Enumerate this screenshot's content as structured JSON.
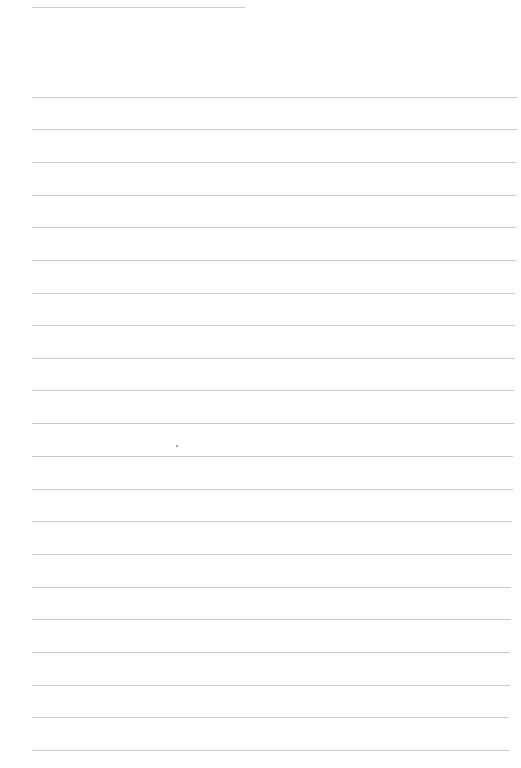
{
  "page": {
    "type": "lined-paper",
    "background": "#ffffff",
    "rule_color": "#c9c9c9",
    "header_rule": {
      "x": 32,
      "y": 7,
      "width": 213
    },
    "rules": [
      {
        "y": 97,
        "x": 32,
        "width": 485
      },
      {
        "y": 129,
        "x": 32,
        "width": 485
      },
      {
        "y": 162,
        "x": 32,
        "width": 484
      },
      {
        "y": 195,
        "x": 32,
        "width": 484
      },
      {
        "y": 227,
        "x": 32,
        "width": 484
      },
      {
        "y": 260,
        "x": 32,
        "width": 484
      },
      {
        "y": 293,
        "x": 32,
        "width": 483
      },
      {
        "y": 325,
        "x": 32,
        "width": 483
      },
      {
        "y": 358,
        "x": 32,
        "width": 483
      },
      {
        "y": 390,
        "x": 32,
        "width": 482
      },
      {
        "y": 423,
        "x": 32,
        "width": 482
      },
      {
        "y": 456,
        "x": 32,
        "width": 481
      },
      {
        "y": 489,
        "x": 32,
        "width": 481
      },
      {
        "y": 521,
        "x": 32,
        "width": 480
      },
      {
        "y": 554,
        "x": 32,
        "width": 480
      },
      {
        "y": 587,
        "x": 32,
        "width": 479
      },
      {
        "y": 619,
        "x": 32,
        "width": 479
      },
      {
        "y": 652,
        "x": 32,
        "width": 478
      },
      {
        "y": 685,
        "x": 32,
        "width": 478
      },
      {
        "y": 717,
        "x": 32,
        "width": 477
      },
      {
        "y": 750,
        "x": 32,
        "width": 477
      }
    ],
    "specks": [
      {
        "x": 176,
        "y": 445
      }
    ]
  }
}
